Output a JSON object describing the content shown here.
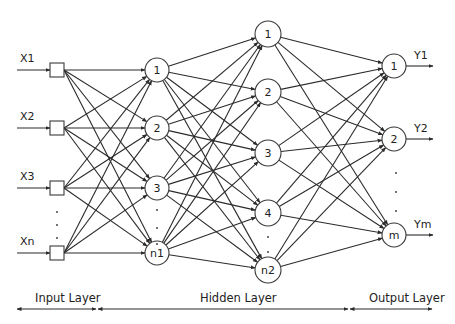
{
  "diagram": {
    "type": "neural-network",
    "colors": {
      "line": "#2b2b2b",
      "node_fill": "#ffffff",
      "background": "#ffffff"
    },
    "inputs": [
      {
        "label": "X1",
        "y": 70
      },
      {
        "label": "X2",
        "y": 128
      },
      {
        "label": "X3",
        "y": 188
      },
      {
        "label": "Xn",
        "y": 253
      }
    ],
    "input_ellipsis": "·",
    "hidden1": [
      {
        "label": "1",
        "y": 70
      },
      {
        "label": "2",
        "y": 128
      },
      {
        "label": "3",
        "y": 188
      },
      {
        "label": "n1",
        "y": 253
      }
    ],
    "hidden2": [
      {
        "label": "1",
        "y": 34
      },
      {
        "label": "2",
        "y": 92
      },
      {
        "label": "3",
        "y": 153
      },
      {
        "label": "4",
        "y": 213
      },
      {
        "label": "n2",
        "y": 270
      }
    ],
    "outputs": [
      {
        "label": "1",
        "y": 66,
        "out_label": "Y1"
      },
      {
        "label": "2",
        "y": 139,
        "out_label": "Y2"
      },
      {
        "label": "m",
        "y": 235,
        "out_label": "Ym"
      }
    ],
    "layers": {
      "input": "Input Layer",
      "hidden": "Hidden Layer",
      "output": "Output Layer"
    }
  }
}
